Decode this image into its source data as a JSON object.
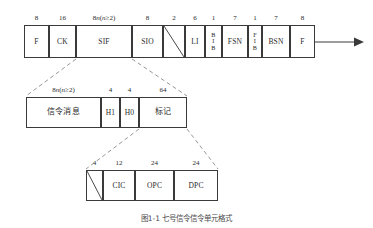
{
  "figure": {
    "caption": "图1-1  七号信令信令单元格式",
    "line_color": "#3a3a3a",
    "text_color": "#2b2b2b"
  },
  "row1": {
    "name": "msu-frame",
    "fields": [
      {
        "bits": "8",
        "label": "F",
        "type": "text"
      },
      {
        "bits": "16",
        "label": "CK",
        "type": "text"
      },
      {
        "bits": "8n(n≥2)",
        "label": "SIF",
        "type": "text",
        "italic_n": true
      },
      {
        "bits": "8",
        "label": "SIO",
        "type": "text"
      },
      {
        "bits": "2",
        "label": "",
        "type": "spare"
      },
      {
        "bits": "6",
        "label": "LI",
        "type": "text"
      },
      {
        "bits": "1",
        "label": "BIB",
        "type": "stacked"
      },
      {
        "bits": "7",
        "label": "FSN",
        "type": "text"
      },
      {
        "bits": "1",
        "label": "FIB",
        "type": "stacked"
      },
      {
        "bits": "7",
        "label": "BSN",
        "type": "text"
      },
      {
        "bits": "8",
        "label": "F",
        "type": "text"
      }
    ],
    "direction_arrow": "arrow-right-icon"
  },
  "row2": {
    "name": "sif-expansion",
    "fields": [
      {
        "bits": "8n(n≥2)",
        "label": "信令消息",
        "type": "cjk",
        "italic_n": true
      },
      {
        "bits": "4",
        "label": "H1",
        "type": "text"
      },
      {
        "bits": "4",
        "label": "H0",
        "type": "text"
      },
      {
        "bits": "64",
        "label": "标记",
        "type": "cjk"
      }
    ]
  },
  "row3": {
    "name": "label-expansion",
    "fields": [
      {
        "bits": "4",
        "label": "",
        "type": "spare"
      },
      {
        "bits": "12",
        "label": "CIC",
        "type": "text"
      },
      {
        "bits": "24",
        "label": "OPC",
        "type": "text"
      },
      {
        "bits": "24",
        "label": "DPC",
        "type": "text"
      }
    ]
  }
}
